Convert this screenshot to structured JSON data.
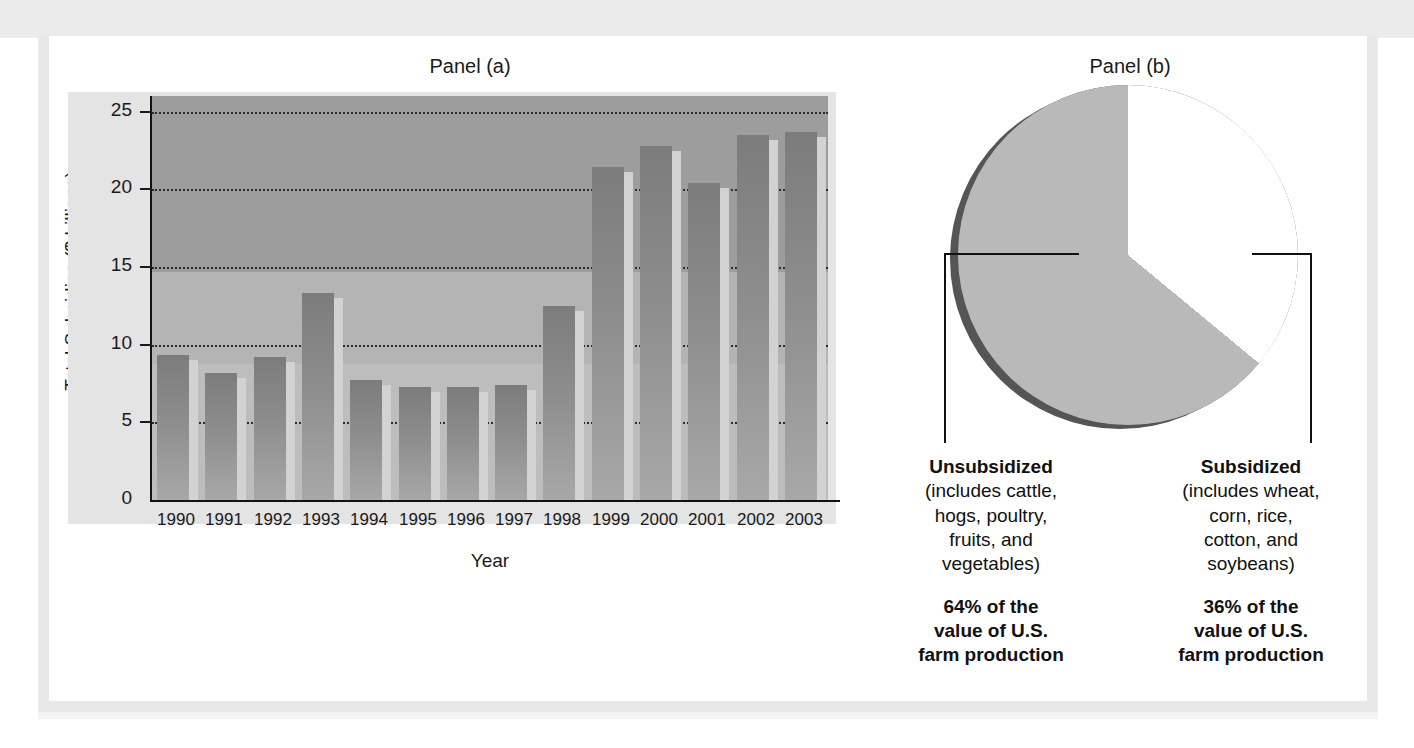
{
  "figure": {
    "clipped_caption": "",
    "panel_a_title": "Panel (a)",
    "panel_b_title": "Panel (b)"
  },
  "chart_data": [
    {
      "type": "bar",
      "title": "Panel (a)",
      "xlabel": "Year",
      "ylabel": "Total Subsidies ($ billions)",
      "categories": [
        "1990",
        "1991",
        "1992",
        "1993",
        "1994",
        "1995",
        "1996",
        "1997",
        "1998",
        "1999",
        "2000",
        "2001",
        "2002",
        "2003"
      ],
      "values": [
        9.3,
        8.2,
        9.2,
        13.3,
        7.7,
        7.3,
        7.3,
        7.4,
        12.5,
        21.4,
        22.8,
        20.4,
        23.5,
        23.7
      ],
      "ylim": [
        0,
        26
      ],
      "yticks": [
        0,
        5,
        10,
        15,
        20,
        25
      ],
      "ytick_labels": [
        "0",
        "5",
        "10",
        "15",
        "20",
        "25"
      ],
      "grid": true,
      "legend": "none"
    },
    {
      "type": "pie",
      "title": "Panel (b)",
      "labels": [
        "Unsubsidized",
        "Subsidized"
      ],
      "values": [
        64,
        36
      ],
      "value_labels": [
        "64%",
        "36%"
      ],
      "slice_colors": [
        "#b9b9b9",
        "#ffffff"
      ],
      "start_angle_deg": 90,
      "direction": "counterclockwise",
      "annotations": [
        {
          "heading": "Unsubsidized",
          "detail": "(includes cattle, hogs, poultry, fruits, and vegetables)",
          "detail_lines": [
            "(includes cattle,",
            "hogs, poultry,",
            "fruits, and",
            "vegetables)"
          ],
          "percent_lines": [
            "64% of the",
            "value of U.S.",
            "farm production"
          ]
        },
        {
          "heading": "Subsidized",
          "detail": "(includes wheat, corn, rice, cotton, and soybeans)",
          "detail_lines": [
            "(includes wheat,",
            "corn, rice,",
            "cotton, and",
            "soybeans)"
          ],
          "percent_lines": [
            "36% of the",
            "value of U.S.",
            "farm production"
          ]
        }
      ]
    }
  ],
  "colors": {
    "page_background": "#ffffff",
    "frame_border": "#e8e8e8",
    "top_band": "#ebebeb",
    "plot_background": "#9d9d9d",
    "plot_background_light": "#b4b4b4",
    "bar_fill": "#8a8a8a",
    "bar_highlight": "#d2d2d2",
    "bar_foot": "#4a4a4a",
    "gridline": "#2b2b2b",
    "axis": "#111111",
    "text": "#1a1a1a",
    "pie_gray_slice": "#b9b9b9",
    "pie_white_slice": "#ffffff",
    "pie_rim_shadow": "#555555"
  }
}
